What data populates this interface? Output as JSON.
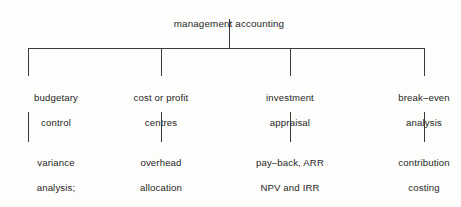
{
  "diagram": {
    "type": "organization-tree",
    "title": "management accounting",
    "line_color": "#3a3a3a",
    "text_color": "#262626",
    "background_color": "#fdfdfb",
    "root": {
      "label": "management accounting"
    },
    "branches": [
      {
        "id": "budgetary-control",
        "label_line1": "budgetary",
        "label_line2": "control",
        "leaf": {
          "line1": "variance",
          "line2": "analysis;",
          "line3": "cash–flow",
          "line4": "forecasts"
        }
      },
      {
        "id": "cost-or-profit-centres",
        "label_line1": "cost or profit",
        "label_line2": "centres",
        "leaf": {
          "line1": "overhead",
          "line2": "allocation",
          "line3": "",
          "line4": ""
        }
      },
      {
        "id": "investment-appraisal",
        "label_line1": "investment",
        "label_line2": "appraisal",
        "leaf": {
          "line1": "pay–back, ARR",
          "line2": "NPV and IRR",
          "line3": "",
          "line4": ""
        }
      },
      {
        "id": "break-even-analysis",
        "label_line1": "break–even",
        "label_line2": "analysis",
        "leaf": {
          "line1": "contribution",
          "line2": "costing",
          "line3": "",
          "line4": ""
        }
      }
    ]
  }
}
